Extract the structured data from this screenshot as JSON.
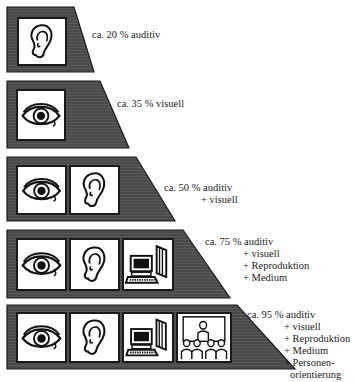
{
  "colors": {
    "band_fill": "#555555",
    "band_stroke": "#1a1a1a",
    "box_fill": "#ffffff",
    "text": "#1a1a1a"
  },
  "bands": [
    {
      "id": 1,
      "icons": [
        "ear-icon"
      ],
      "label": {
        "head": "ca. 20 % auditiv",
        "lines": []
      }
    },
    {
      "id": 2,
      "icons": [
        "eye-icon"
      ],
      "label": {
        "head": "ca. 35 % visuell",
        "lines": []
      }
    },
    {
      "id": 3,
      "icons": [
        "eye-icon",
        "ear-icon"
      ],
      "label": {
        "head": "ca. 50 % auditiv",
        "lines": [
          "+ visuell"
        ]
      }
    },
    {
      "id": 4,
      "icons": [
        "eye-icon",
        "ear-icon",
        "computer-book-icon"
      ],
      "label": {
        "head": "ca. 75 % auditiv",
        "lines": [
          "+ visuell",
          "+ Reproduktion",
          "+ Medium"
        ]
      }
    },
    {
      "id": 5,
      "icons": [
        "eye-icon",
        "ear-icon",
        "computer-book-icon",
        "presenter-audience-icon"
      ],
      "label": {
        "head": "ca. 95 % auditiv",
        "lines": [
          "+ visuell",
          "+ Reproduktion",
          "+ Medium",
          "+ Personen-",
          "orientierung"
        ]
      }
    }
  ]
}
